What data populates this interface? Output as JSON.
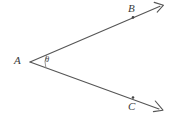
{
  "figure": {
    "type": "geometry-angle-diagram",
    "background_color": "#ffffff",
    "stroke_color": "#555555",
    "label_color": "#3a3a3a",
    "width": 169,
    "height": 116,
    "vertex": {
      "name": "A",
      "label": "A",
      "x": 30,
      "y": 62
    },
    "angle_mark": {
      "name": "theta",
      "label": "θ",
      "arc_radius": 16,
      "x": 45,
      "y": 55
    },
    "rays": [
      {
        "name": "ray-AB",
        "through_point_label": "B",
        "from_x": 30,
        "from_y": 62,
        "to_x": 163,
        "to_y": 5,
        "point_marker_x": 133,
        "point_marker_y": 17,
        "label_x": 128,
        "label_y": 3,
        "arrowhead": "open-v"
      },
      {
        "name": "ray-AC",
        "through_point_label": "C",
        "from_x": 30,
        "from_y": 62,
        "to_x": 162,
        "to_y": 110,
        "point_marker_x": 133,
        "point_marker_y": 97,
        "label_x": 128,
        "label_y": 101,
        "arrowhead": "open-v"
      }
    ]
  }
}
